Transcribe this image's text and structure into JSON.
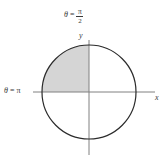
{
  "figure": {
    "background_color": "#ffffff",
    "width": 165,
    "height": 160
  },
  "chart_data": {
    "type": "scatter",
    "title": "",
    "subtitle": "",
    "xlabel": "x",
    "ylabel": "y",
    "grid": false,
    "legend": false,
    "axes": {
      "x_axis": {
        "label": "x",
        "label_style": "italic",
        "orientation": "horizontal",
        "start_px": 33,
        "end_px": 155,
        "y_px": 92,
        "color": "#808080"
      },
      "y_axis": {
        "label": "y",
        "label_style": "italic",
        "orientation": "vertical",
        "start_px": 40,
        "end_px": 155,
        "x_px": 89,
        "color": "#808080"
      }
    },
    "circle": {
      "center_x_px": 89,
      "center_y_px": 92,
      "radius_px": 47,
      "stroke_color": "#2b2b2b",
      "stroke_width": 1.2,
      "fill": "none",
      "equation_hint": "r = 1"
    },
    "shaded_region": {
      "name": "second-quadrant-quarter-disk",
      "quadrant": 2,
      "theta_start": "pi/2",
      "theta_end": "pi",
      "fill_color": "#d5d5d5",
      "opacity": 1
    },
    "annotations": [
      {
        "id": "theta-pi",
        "text": "theta = pi",
        "theta_symbol": "θ",
        "equals": "=",
        "value": "π",
        "position": "left",
        "x_px": 4,
        "y_px": 87,
        "color": "#3a3a3a"
      },
      {
        "id": "theta-half-pi",
        "text": "theta = pi/2",
        "theta_symbol": "θ",
        "equals": "=",
        "numerator": "π",
        "denominator": "2",
        "position": "top",
        "x_px": 64,
        "y_px": 11,
        "color": "#3a3a3a"
      }
    ],
    "colors": {
      "axis": "#808080",
      "curve": "#2b2b2b",
      "shade": "#d5d5d5",
      "text": "#3a3a3a",
      "background": "#ffffff"
    }
  }
}
